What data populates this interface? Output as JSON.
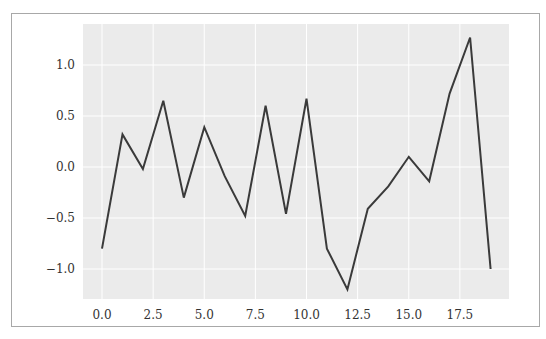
{
  "chart_data": {
    "type": "line",
    "title": "",
    "xlabel": "",
    "ylabel": "",
    "x": [
      0,
      1,
      2,
      3,
      4,
      5,
      6,
      7,
      8,
      9,
      10,
      11,
      12,
      13,
      14,
      15,
      16,
      17,
      18,
      19
    ],
    "series": [
      {
        "name": "series",
        "values": [
          -0.8,
          0.32,
          -0.02,
          0.65,
          -0.3,
          0.39,
          -0.09,
          -0.48,
          0.6,
          -0.46,
          0.67,
          -0.8,
          -1.2,
          -0.41,
          -0.19,
          0.1,
          -0.14,
          0.72,
          1.27,
          -1.0
        ],
        "color": "#3a3a3a"
      }
    ],
    "xticks": [
      0.0,
      2.5,
      5.0,
      7.5,
      10.0,
      12.5,
      15.0,
      17.5
    ],
    "xtick_labels": [
      "0.0",
      "2.5",
      "5.0",
      "7.5",
      "10.0",
      "12.5",
      "15.0",
      "17.5"
    ],
    "yticks": [
      -1.0,
      -0.5,
      0.0,
      0.5,
      1.0
    ],
    "ytick_labels": [
      "−1.0",
      "−0.5",
      "0.0",
      "0.5",
      "1.0"
    ],
    "xlim": [
      -0.95,
      19.95
    ],
    "ylim": [
      -1.3,
      1.4
    ],
    "grid": true,
    "legend": null,
    "style": "ggplot-like gray background with white gridlines"
  },
  "colors": {
    "plot_background": "#ebebeb",
    "grid": "#ffffff",
    "line": "#3a3a3a",
    "frame": "#a8a8a8",
    "text": "#333333"
  }
}
